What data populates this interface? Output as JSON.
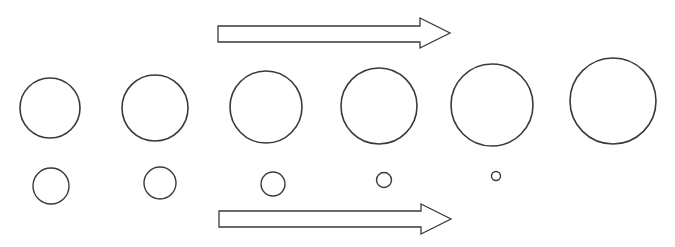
{
  "diagram": {
    "stroke_color": "#3a3a3a",
    "fill_color": "#ffffff",
    "arrows": [
      {
        "id": "top-arrow",
        "direction": "right",
        "shaft_x1": 218,
        "shaft_x2": 420,
        "y_top": 26,
        "y_bottom": 42,
        "head_top": 18,
        "head_bottom": 48,
        "tip_x": 450
      },
      {
        "id": "bottom-arrow",
        "direction": "right",
        "shaft_x1": 219,
        "shaft_x2": 421,
        "y_top": 211,
        "y_bottom": 227,
        "head_top": 204,
        "head_bottom": 234,
        "tip_x": 451
      }
    ],
    "large_circles": [
      {
        "cx": 50,
        "cy": 108,
        "r": 30
      },
      {
        "cx": 155,
        "cy": 108,
        "r": 33
      },
      {
        "cx": 266,
        "cy": 107,
        "r": 36
      },
      {
        "cx": 379,
        "cy": 106,
        "r": 38
      },
      {
        "cx": 492,
        "cy": 105,
        "r": 41
      },
      {
        "cx": 613,
        "cy": 101,
        "r": 43
      }
    ],
    "small_circles": [
      {
        "cx": 51,
        "cy": 186,
        "r": 18
      },
      {
        "cx": 160,
        "cy": 183,
        "r": 16
      },
      {
        "cx": 273,
        "cy": 184,
        "r": 12
      },
      {
        "cx": 384,
        "cy": 180,
        "r": 7.5
      },
      {
        "cx": 496,
        "cy": 176,
        "r": 4.5
      }
    ]
  }
}
